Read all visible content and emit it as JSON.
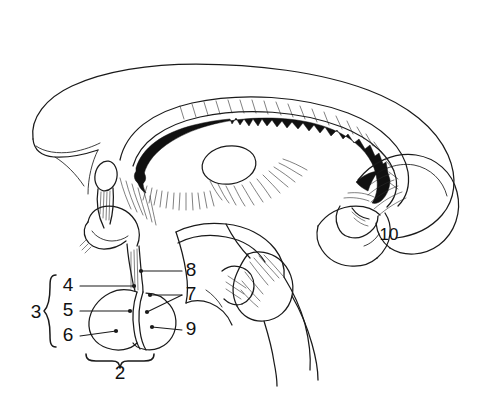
{
  "figure": {
    "background_color": "#ffffff",
    "ink_color": "#1a1a1a",
    "width": 483,
    "height": 405,
    "style": "black-and-white line drawing"
  },
  "labels": [
    {
      "id": "label-2",
      "text": "2",
      "x": 120,
      "y": 379,
      "anchor": "middle",
      "size": "large"
    },
    {
      "id": "label-3",
      "text": "3",
      "x": 36,
      "y": 318,
      "anchor": "middle",
      "size": "large"
    },
    {
      "id": "label-4",
      "text": "4",
      "x": 68,
      "y": 291,
      "anchor": "middle",
      "size": "large"
    },
    {
      "id": "label-5",
      "text": "5",
      "x": 68,
      "y": 316,
      "anchor": "middle",
      "size": "large"
    },
    {
      "id": "label-6",
      "text": "6",
      "x": 68,
      "y": 341,
      "anchor": "middle",
      "size": "large"
    },
    {
      "id": "label-7",
      "text": "7",
      "x": 191,
      "y": 300,
      "anchor": "middle",
      "size": "large"
    },
    {
      "id": "label-8",
      "text": "8",
      "x": 191,
      "y": 276,
      "anchor": "middle",
      "size": "large"
    },
    {
      "id": "label-9",
      "text": "9",
      "x": 191,
      "y": 335,
      "anchor": "middle",
      "size": "large"
    },
    {
      "id": "label-10",
      "text": "10",
      "x": 389,
      "y": 240,
      "anchor": "middle",
      "size": "small"
    }
  ],
  "braces": {
    "left_brace_label": "3",
    "left_brace_groups": [
      "4",
      "5",
      "6"
    ],
    "bottom_brace_label": "2"
  },
  "regions": {
    "cerebrum": "cerebral-hemisphere-outline",
    "corpus_callosum": "corpus-callosum",
    "choroid_plexus": "choroid-plexus-jagged-band",
    "thalamus": "thalamus-oval",
    "optic_chiasm": "optic-chiasm",
    "infundibulum": "pituitary-stalk",
    "anterior_pituitary": "anterior-lobe",
    "posterior_pituitary": "posterior-lobe",
    "brainstem": "brainstem",
    "cerebellum": "cerebellum"
  }
}
